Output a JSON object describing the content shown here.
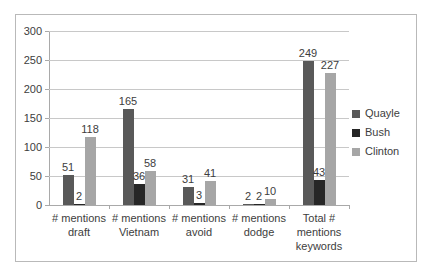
{
  "chart_data": {
    "type": "bar",
    "title": "",
    "subtitle": "",
    "xlabel": "",
    "ylabel": "",
    "ylim": [
      0,
      300
    ],
    "yticks": [
      0,
      50,
      100,
      150,
      200,
      250,
      300
    ],
    "grid": true,
    "legend_position": "right",
    "categories": [
      "# mentions draft",
      "# mentions Vietnam",
      "# mentions avoid",
      "# mentions dodge",
      "Total # mentions keywords"
    ],
    "series": [
      {
        "name": "Quayle",
        "color": "#595959",
        "values": [
          51,
          165,
          31,
          2,
          249
        ]
      },
      {
        "name": "Bush",
        "color": "#262626",
        "values": [
          2,
          36,
          3,
          2,
          43
        ]
      },
      {
        "name": "Clinton",
        "color": "#a6a6a6",
        "values": [
          118,
          58,
          41,
          10,
          227
        ]
      }
    ],
    "data_labels": [
      [
        "51",
        "2",
        "118"
      ],
      [
        "165",
        "36",
        "58"
      ],
      [
        "31",
        "3",
        "41"
      ],
      [
        "2",
        "2",
        "10"
      ],
      [
        "249",
        "43",
        "227"
      ]
    ]
  },
  "axis": {
    "ytick_labels": [
      "0",
      "50",
      "100",
      "150",
      "200",
      "250",
      "300"
    ]
  },
  "legend": {
    "items": [
      {
        "label": "Quayle",
        "color": "#595959"
      },
      {
        "label": "Bush",
        "color": "#262626"
      },
      {
        "label": "Clinton",
        "color": "#a6a6a6"
      }
    ]
  }
}
